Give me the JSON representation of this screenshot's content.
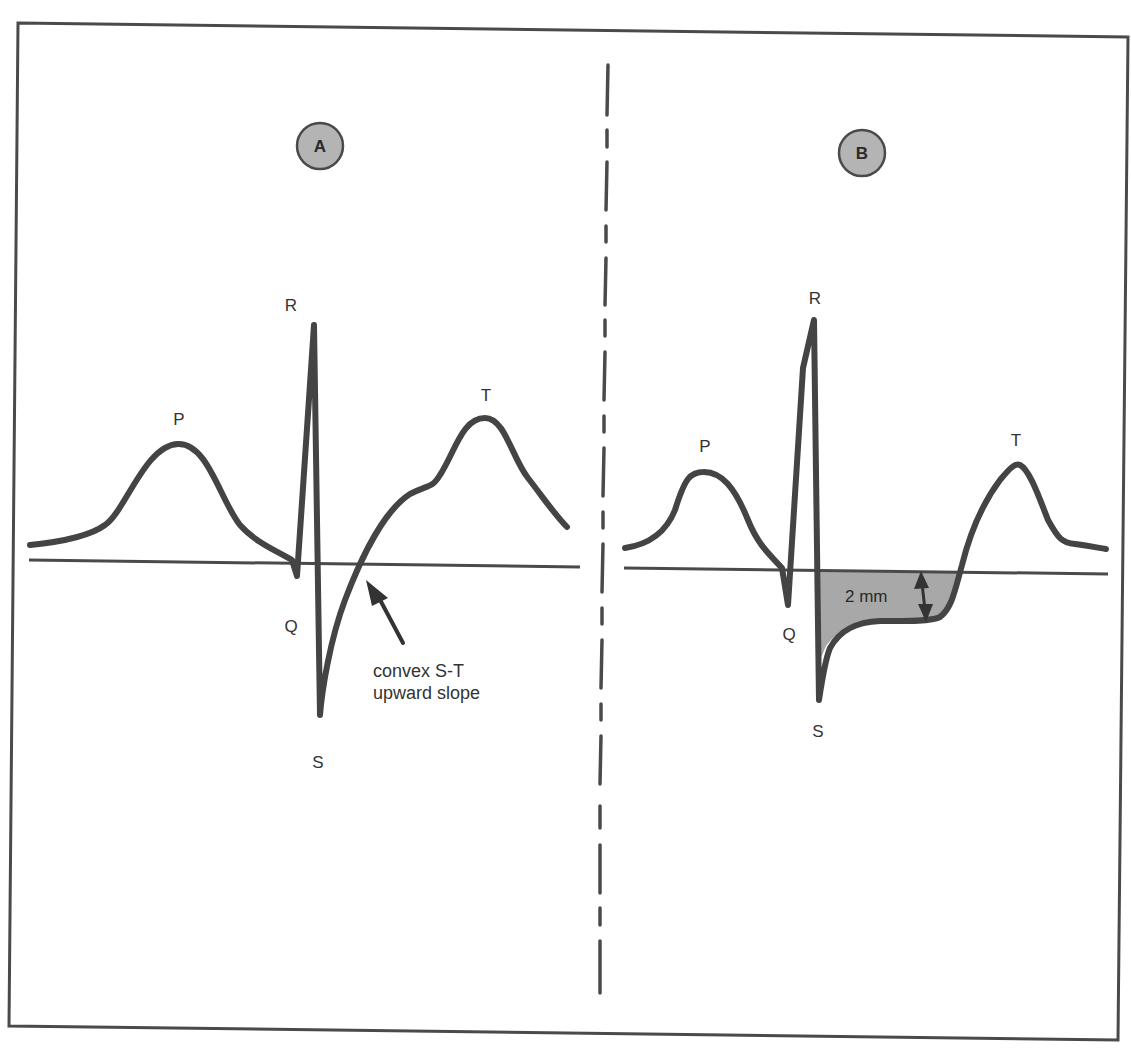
{
  "panels": [
    {
      "id": "A",
      "badge": "A",
      "labels": {
        "p": "P",
        "q": "Q",
        "r": "R",
        "s": "S",
        "t": "T"
      },
      "annotation": {
        "line1": "convex S-T",
        "line2": "upward slope"
      }
    },
    {
      "id": "B",
      "badge": "B",
      "labels": {
        "p": "P",
        "q": "Q",
        "r": "R",
        "s": "S",
        "t": "T"
      },
      "depression_label": "2 mm"
    }
  ],
  "colors": {
    "line": "#444444",
    "badge_fill": "#b4b4b4",
    "depression_fill": "#a8a8a8",
    "background": "#ffffff"
  }
}
